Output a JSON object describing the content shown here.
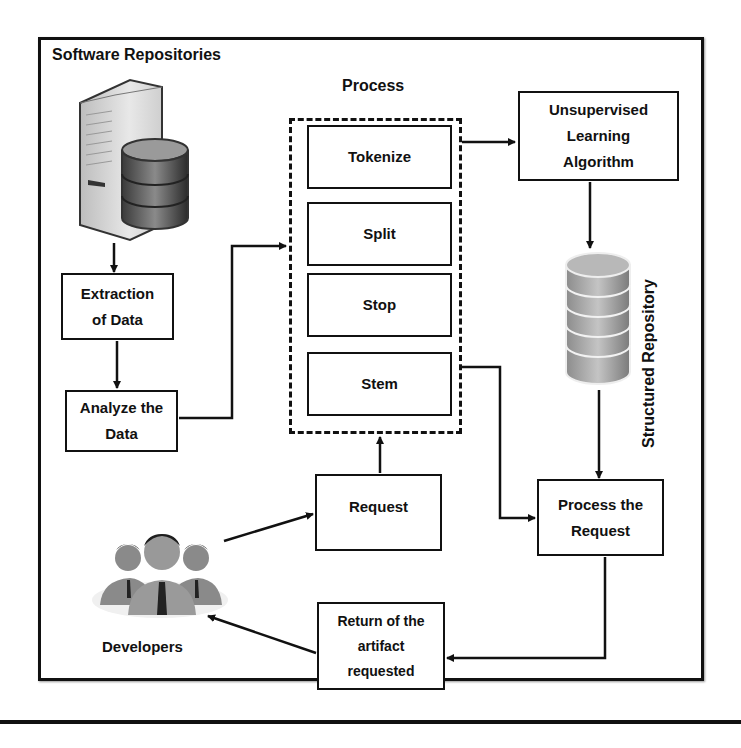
{
  "diagram": {
    "title": "Software Repositories",
    "process_group_label": "Process",
    "process_steps": [
      {
        "label": "Tokenize"
      },
      {
        "label": "Split"
      },
      {
        "label": "Stop"
      },
      {
        "label": "Stem"
      }
    ],
    "nodes": {
      "extraction": "Extraction\nof Data",
      "analyze": "Analyze the\nData",
      "unsupervised": "Unsupervised\nLearning\nAlgorithm",
      "structured_repository": "Structured Repository",
      "request": "Request",
      "process_request": "Process the\nRequest",
      "return_artifact": "Return of the\nartifact\nrequested",
      "developers": "Developers"
    },
    "icons": {
      "server": "server-database-icon",
      "repository": "database-cylinder-icon",
      "developers": "people-group-icon"
    },
    "edges": [
      {
        "from": "Software Repositories",
        "to": "Extraction of Data"
      },
      {
        "from": "Extraction of Data",
        "to": "Analyze the Data"
      },
      {
        "from": "Analyze the Data",
        "to": "Process"
      },
      {
        "from": "Process",
        "to": "Unsupervised Learning Algorithm"
      },
      {
        "from": "Unsupervised Learning Algorithm",
        "to": "Structured Repository"
      },
      {
        "from": "Structured Repository",
        "to": "Process the Request"
      },
      {
        "from": "Stem",
        "to": "Process the Request"
      },
      {
        "from": "Developers",
        "to": "Request"
      },
      {
        "from": "Request",
        "to": "Process"
      },
      {
        "from": "Process the Request",
        "to": "Return of the artifact requested"
      },
      {
        "from": "Return of the artifact requested",
        "to": "Developers"
      }
    ]
  }
}
